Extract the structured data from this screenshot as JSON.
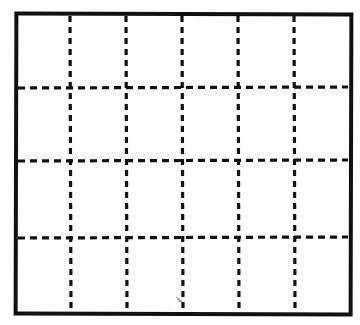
{
  "diagram": {
    "type": "grid",
    "columns": 6,
    "rows": 4,
    "cell_count": 24,
    "border_style": "solid",
    "inner_line_style": "dashed",
    "line_color": "#111111",
    "background_color": "#ffffff",
    "vertical_lines_x": [
      70,
      126,
      182,
      238,
      294
    ],
    "horizontal_lines_y": [
      88,
      161,
      238
    ],
    "frame": {
      "left": 16,
      "top": 14,
      "right": 349,
      "bottom": 312
    }
  }
}
